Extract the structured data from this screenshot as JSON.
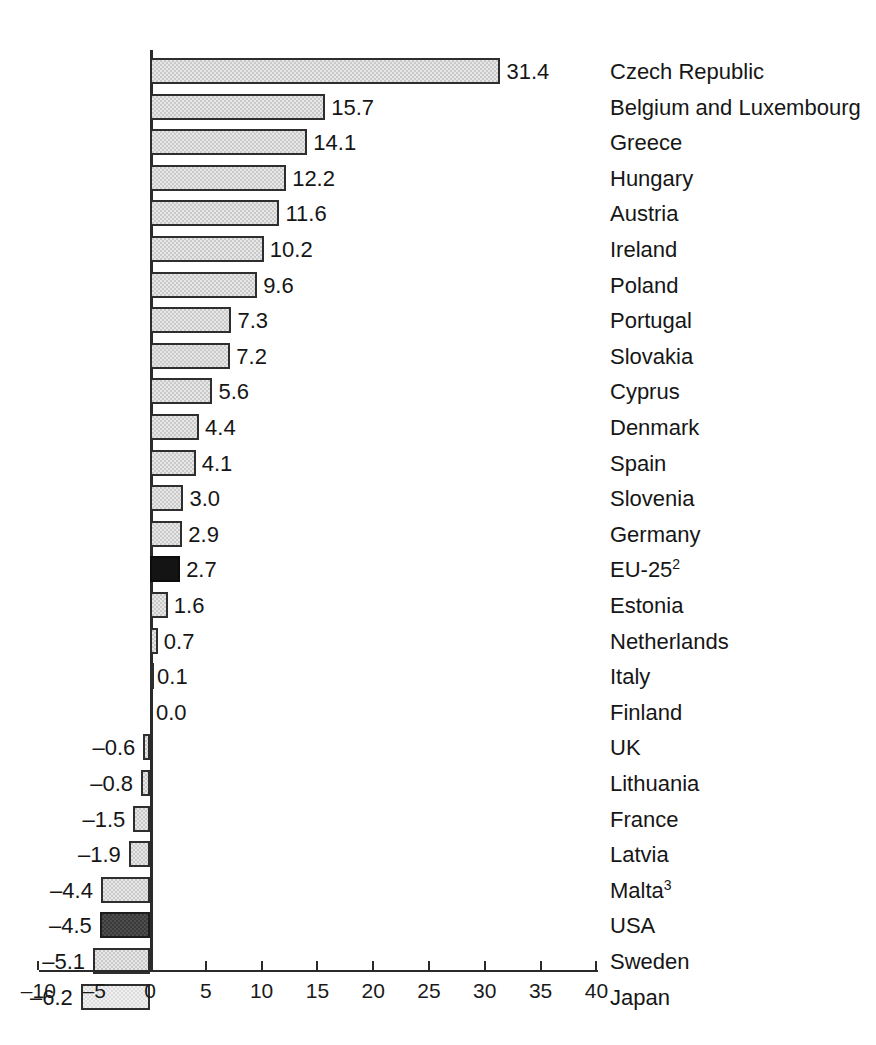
{
  "chart_data": {
    "type": "bar",
    "orientation": "horizontal",
    "title": "",
    "subtitle": "",
    "xlabel": "",
    "ylabel": "",
    "xlim": [
      -10,
      40
    ],
    "xticks": [
      -10,
      -5,
      0,
      5,
      10,
      15,
      20,
      25,
      30,
      35,
      40
    ],
    "xtick_labels": [
      "–10",
      "–5",
      "0",
      "5",
      "10",
      "15",
      "20",
      "25",
      "30",
      "35",
      "40"
    ],
    "grid": false,
    "legend": "none",
    "categories": [
      "Czech Republic",
      "Belgium and Luxembourg",
      "Greece",
      "Hungary",
      "Austria",
      "Ireland",
      "Poland",
      "Portugal",
      "Slovakia",
      "Cyprus",
      "Denmark",
      "Spain",
      "Slovenia",
      "Germany",
      "EU-25",
      "Estonia",
      "Netherlands",
      "Italy",
      "Finland",
      "UK",
      "Lithuania",
      "France",
      "Latvia",
      "Malta",
      "USA",
      "Sweden",
      "Japan"
    ],
    "values": [
      31.4,
      15.7,
      14.1,
      12.2,
      11.6,
      10.2,
      9.6,
      7.3,
      7.2,
      5.6,
      4.4,
      4.1,
      3.0,
      2.9,
      2.7,
      1.6,
      0.7,
      0.1,
      0.0,
      -0.6,
      -0.8,
      -1.5,
      -1.9,
      -4.4,
      -4.5,
      -5.1,
      -6.2
    ],
    "value_labels": [
      "31.4",
      "15.7",
      "14.1",
      "12.2",
      "11.6",
      "10.2",
      "9.6",
      "7.3",
      "7.2",
      "5.6",
      "4.4",
      "4.1",
      "3.0",
      "2.9",
      "2.7",
      "1.6",
      "0.7",
      "0.1",
      "0.0",
      "–0.6",
      "–0.8",
      "–1.5",
      "–1.9",
      "–4.4",
      "–4.5",
      "–5.1",
      "–6.2"
    ],
    "category_superscripts": [
      "",
      "",
      "",
      "",
      "",
      "",
      "",
      "",
      "",
      "",
      "",
      "",
      "",
      "",
      "2",
      "",
      "",
      "",
      "",
      "",
      "",
      "",
      "",
      "3",
      "",
      "",
      ""
    ],
    "bar_tones": [
      "mid",
      "mid",
      "mid",
      "mid",
      "mid",
      "mid",
      "mid",
      "mid",
      "mid",
      "mid",
      "mid",
      "mid",
      "mid",
      "mid",
      "black",
      "mid",
      "mid",
      "mid",
      "mid",
      "mid",
      "mid",
      "mid",
      "mid",
      "mid",
      "dark",
      "mid",
      "light"
    ],
    "colors": {
      "bar_mid": "#c9c9c9",
      "bar_light": "#dcdcdc",
      "bar_dark": "#3a3a3a",
      "bar_black": "#141414",
      "bar_outline": "#2e2e2e",
      "axis": "#2a2a2a",
      "text": "#161616",
      "background": "#ffffff"
    }
  }
}
